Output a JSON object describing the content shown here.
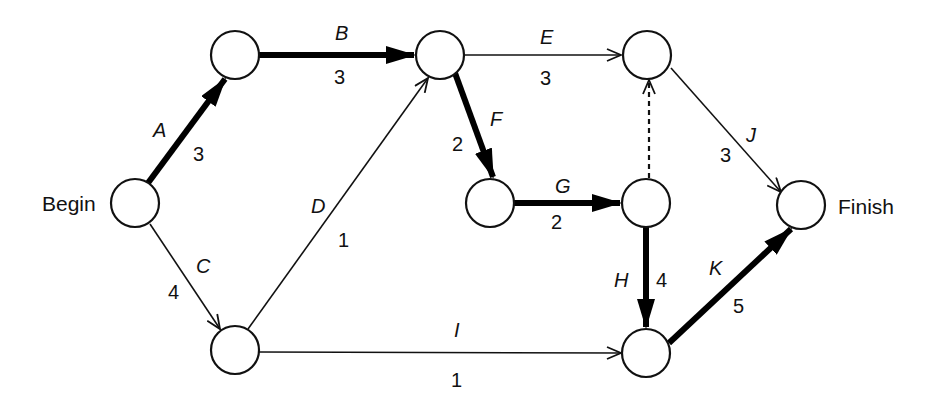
{
  "diagram": {
    "type": "activity-on-arrow network",
    "nodes": [
      {
        "id": "begin",
        "label": "Begin"
      },
      {
        "id": "n1",
        "label": ""
      },
      {
        "id": "n2",
        "label": ""
      },
      {
        "id": "n3",
        "label": ""
      },
      {
        "id": "n4",
        "label": ""
      },
      {
        "id": "n5",
        "label": ""
      },
      {
        "id": "n6",
        "label": ""
      },
      {
        "id": "n7",
        "label": ""
      },
      {
        "id": "finish",
        "label": "Finish"
      }
    ],
    "activities": [
      {
        "name": "A",
        "duration": "3",
        "from": "begin",
        "to": "n1",
        "critical": true
      },
      {
        "name": "B",
        "duration": "3",
        "from": "n1",
        "to": "n2",
        "critical": true
      },
      {
        "name": "C",
        "duration": "4",
        "from": "begin",
        "to": "n6",
        "critical": false
      },
      {
        "name": "D",
        "duration": "1",
        "from": "n6",
        "to": "n2",
        "critical": false
      },
      {
        "name": "E",
        "duration": "3",
        "from": "n2",
        "to": "n3",
        "critical": false
      },
      {
        "name": "F",
        "duration": "2",
        "from": "n2",
        "to": "n4",
        "critical": true
      },
      {
        "name": "G",
        "duration": "2",
        "from": "n4",
        "to": "n5",
        "critical": true
      },
      {
        "name": "H",
        "duration": "4",
        "from": "n5",
        "to": "n7",
        "critical": true
      },
      {
        "name": "I",
        "duration": "1",
        "from": "n6",
        "to": "n7",
        "critical": false
      },
      {
        "name": "J",
        "duration": "3",
        "from": "n3",
        "to": "finish",
        "critical": false
      },
      {
        "name": "K",
        "duration": "5",
        "from": "n7",
        "to": "finish",
        "critical": true
      }
    ],
    "dummy_activities": [
      {
        "from": "n5",
        "to": "n3",
        "style": "dashed"
      }
    ],
    "colors": {
      "line": "#111111",
      "background": "#ffffff"
    }
  }
}
